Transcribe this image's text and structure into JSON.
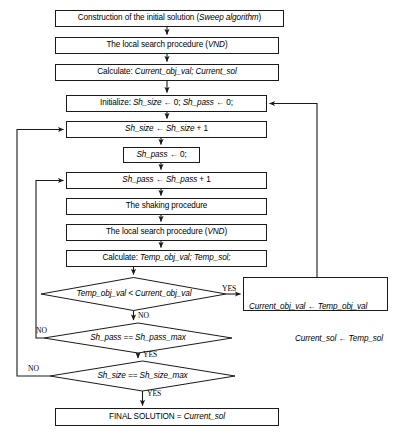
{
  "diagram": {
    "stroke_color": "#1a1a1a",
    "fill_color": "#ffffff",
    "text_color": "#000000"
  },
  "nodes": {
    "construction": {
      "label": "Construction of the initial solution (Sweep algorithm)",
      "plain": "Construction of the initial solution (",
      "italic": "Sweep algorithm",
      "tail": ")",
      "shape": "process"
    },
    "local_search_1": {
      "label": "The local search procedure (VND)",
      "plain": "The local search procedure (",
      "italic": "VND",
      "tail": ")",
      "shape": "process"
    },
    "calculate_current": {
      "label": "Calculate: Current_obj_val; Current_sol",
      "plain": "Calculate: ",
      "italic": "Current_obj_val; Current_sol",
      "tail": "",
      "shape": "process"
    },
    "initialize": {
      "label": "Initialize: Sh_size ← 0; Sh_pass ← 0;",
      "plain": "Initialize: ",
      "italic": "Sh_size",
      "tail": " ← 0; ",
      "italic2": "Sh_pass",
      "tail2": " ← 0;",
      "shape": "process"
    },
    "inc_sh_size": {
      "label": "Sh_size ← Sh_size + 1",
      "italic": "Sh_size",
      "tail": " ← ",
      "italic2": "Sh_size",
      "tail2": " + 1",
      "shape": "process"
    },
    "reset_sh_pass": {
      "label": "Sh_pass ← 0;",
      "italic": "Sh_pass",
      "tail": " ← 0;",
      "shape": "process"
    },
    "inc_sh_pass": {
      "label": "Sh_pass ← Sh_pass + 1",
      "italic": "Sh_pass",
      "tail": " ← ",
      "italic2": "Sh_pass",
      "tail2": " + 1",
      "shape": "process"
    },
    "shaking": {
      "label": "The shaking procedure",
      "plain": "The shaking procedure",
      "shape": "process"
    },
    "local_search_2": {
      "label": "The local search procedure (VND)",
      "plain": "The local search procedure (",
      "italic": "VND",
      "tail": ")",
      "shape": "process"
    },
    "calculate_temp": {
      "label": "Calculate: Temp_obj_val; Temp_sol;",
      "plain": "Calculate: ",
      "italic": "Temp_obj_val; Temp_sol;",
      "tail": "",
      "shape": "process"
    },
    "decision_improve": {
      "label": "Temp_obj_val < Current_obj_val",
      "italic": "Temp_obj_val < Current_obj_val",
      "shape": "decision"
    },
    "update_current": {
      "line1": "Current_obj_val ← Temp_obj_val",
      "line2": "Current_sol ← Temp_sol",
      "shape": "process"
    },
    "decision_pass_max": {
      "label": "Sh_pass == Sh_pass_max",
      "italic": "Sh_pass == Sh_pass_max",
      "shape": "decision"
    },
    "decision_size_max": {
      "label": "Sh_size == Sh_size_max",
      "italic": "Sh_size == Sh_size_max",
      "shape": "decision"
    },
    "final_solution": {
      "label": "FINAL SOLUTION = Current_sol",
      "plain": "FINAL SOLUTION = ",
      "italic": "Current_sol",
      "tail": "",
      "shape": "process"
    }
  },
  "edge_labels": {
    "improve_yes": "YES",
    "improve_no": "NO",
    "pass_max_no": "NO",
    "pass_max_yes": "YES",
    "size_max_no": "NO",
    "size_max_yes": "YES"
  }
}
